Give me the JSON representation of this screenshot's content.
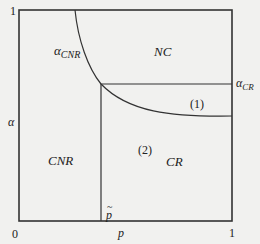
{
  "diagram": {
    "axes": {
      "y_axis_label": "α",
      "x_axis_label": "p",
      "origin_label": "0",
      "y_max_label": "1",
      "x_max_label": "1"
    },
    "thresholds": {
      "p_tilde_label": "p",
      "p_tilde_accent": "~",
      "alpha_cr_symbol": "α",
      "alpha_cr_subscript": "CR",
      "alpha_cnr_symbol": "α",
      "alpha_cnr_subscript": "CNR"
    },
    "regions": {
      "nc": "NC",
      "cnr": "CNR",
      "cr": "CR",
      "sub_region_1": "(1)",
      "sub_region_2": "(2)"
    },
    "colors": {
      "background": "#f1f1ef",
      "line": "#333333",
      "text": "#222222"
    }
  }
}
